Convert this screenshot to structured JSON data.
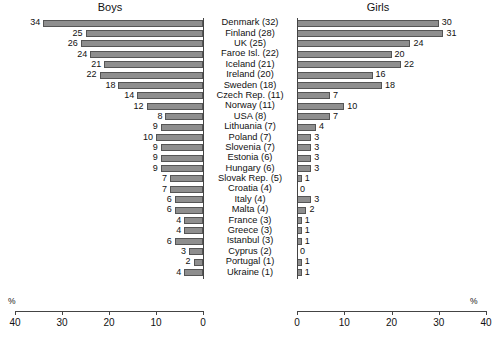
{
  "chart_data": {
    "type": "bar",
    "orientation": "horizontal",
    "layout": "diverging-pyramid",
    "title": "",
    "panels": [
      {
        "name": "boys",
        "label": "Boys",
        "axis_label": "%",
        "ticks": [
          40,
          30,
          20,
          10,
          0
        ],
        "xlim": [
          40,
          0
        ],
        "direction": "right-to-left"
      },
      {
        "name": "girls",
        "label": "Girls",
        "axis_label": "%",
        "ticks": [
          0,
          10,
          20,
          30,
          40
        ],
        "xlim": [
          0,
          40
        ],
        "direction": "left-to-right"
      }
    ],
    "categories": [
      "Denmark (32)",
      "Finland (28)",
      "UK (25)",
      "Faroe Isl. (22)",
      "Iceland (21)",
      "Ireland (20)",
      "Sweden (18)",
      "Czech Rep. (11)",
      "Norway (11)",
      "USA (8)",
      "Lithuania (7)",
      "Poland (7)",
      "Slovenia (7)",
      "Estonia (6)",
      "Hungary (6)",
      "Slovak Rep. (5)",
      "Croatia (4)",
      "Italy (4)",
      "Malta (4)",
      "France (3)",
      "Greece (3)",
      "Istanbul (3)",
      "Cyprus (2)",
      "Portugal (1)",
      "Ukraine (1)"
    ],
    "series": [
      {
        "name": "Boys",
        "values": [
          34,
          25,
          26,
          24,
          21,
          22,
          18,
          14,
          12,
          8,
          9,
          10,
          9,
          9,
          9,
          7,
          7,
          6,
          6,
          4,
          4,
          6,
          3,
          2,
          4
        ]
      },
      {
        "name": "Girls",
        "values": [
          30,
          31,
          24,
          20,
          22,
          16,
          18,
          7,
          10,
          7,
          4,
          3,
          3,
          3,
          3,
          1,
          0,
          3,
          2,
          1,
          1,
          1,
          0,
          1,
          1
        ]
      }
    ],
    "xlabel": "%",
    "ylabel": "",
    "grid": false,
    "legend": "none"
  },
  "rows": [
    {
      "label": "Denmark (32)",
      "boys": "34",
      "girls": "30"
    },
    {
      "label": "Finland (28)",
      "boys": "25",
      "girls": "31"
    },
    {
      "label": "UK (25)",
      "boys": "26",
      "girls": "24"
    },
    {
      "label": "Faroe Isl. (22)",
      "boys": "24",
      "girls": "20"
    },
    {
      "label": "Iceland (21)",
      "boys": "21",
      "girls": "22"
    },
    {
      "label": "Ireland (20)",
      "boys": "22",
      "girls": "16"
    },
    {
      "label": "Sweden (18)",
      "boys": "18",
      "girls": "18"
    },
    {
      "label": "Czech Rep. (11)",
      "boys": "14",
      "girls": "7"
    },
    {
      "label": "Norway (11)",
      "boys": "12",
      "girls": "10"
    },
    {
      "label": "USA (8)",
      "boys": "8",
      "girls": "7"
    },
    {
      "label": "Lithuania (7)",
      "boys": "9",
      "girls": "4"
    },
    {
      "label": "Poland (7)",
      "boys": "10",
      "girls": "3"
    },
    {
      "label": "Slovenia (7)",
      "boys": "9",
      "girls": "3"
    },
    {
      "label": "Estonia (6)",
      "boys": "9",
      "girls": "3"
    },
    {
      "label": "Hungary (6)",
      "boys": "9",
      "girls": "3"
    },
    {
      "label": "Slovak Rep. (5)",
      "boys": "7",
      "girls": "1"
    },
    {
      "label": "Croatia (4)",
      "boys": "7",
      "girls": "0"
    },
    {
      "label": "Italy (4)",
      "boys": "6",
      "girls": "3"
    },
    {
      "label": "Malta (4)",
      "boys": "6",
      "girls": "2"
    },
    {
      "label": "France (3)",
      "boys": "4",
      "girls": "1"
    },
    {
      "label": "Greece (3)",
      "boys": "4",
      "girls": "1"
    },
    {
      "label": "Istanbul (3)",
      "boys": "6",
      "girls": "1"
    },
    {
      "label": "Cyprus (2)",
      "boys": "3",
      "girls": "0"
    },
    {
      "label": "Portugal (1)",
      "boys": "2",
      "girls": "1"
    },
    {
      "label": "Ukraine (1)",
      "boys": "4",
      "girls": "1"
    }
  ],
  "axis": {
    "left_ticks": [
      "40",
      "30",
      "20",
      "10",
      "0"
    ],
    "right_ticks": [
      "0",
      "10",
      "20",
      "30",
      "40"
    ],
    "unit_left": "%",
    "unit_right": "%"
  },
  "style": {
    "bar_fill": "#8e8e8e",
    "bar_stroke": "#555555",
    "axis_color": "#444444",
    "text_color": "#111111",
    "background": "#ffffff"
  }
}
